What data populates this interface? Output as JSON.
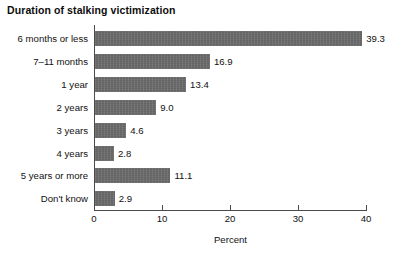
{
  "chart_data": {
    "type": "bar",
    "orientation": "horizontal",
    "title": "Duration of stalking victimization",
    "xlabel": "Percent",
    "ylabel": "",
    "xlim": [
      0,
      40
    ],
    "xticks": [
      0,
      10,
      20,
      30,
      40
    ],
    "xtick_labels": [
      "0",
      "10",
      "20",
      "30",
      "40"
    ],
    "grid": false,
    "legend": null,
    "bar_color": "#6b6b6b",
    "axis_color": "#4a4a4a",
    "categories": [
      "6 months or less",
      "7–11 months",
      "1 year",
      "2 years",
      "3 years",
      "4 years",
      "5 years or more",
      "Don't know"
    ],
    "values": [
      39.3,
      16.9,
      13.4,
      9.0,
      4.6,
      2.8,
      11.1,
      2.9
    ],
    "value_labels": [
      "39.3",
      "16.9",
      "13.4",
      "9.0",
      "4.6",
      "2.8",
      "11.1",
      "2.9"
    ]
  }
}
